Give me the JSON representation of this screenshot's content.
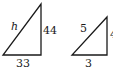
{
  "diagram": {
    "triangles": [
      {
        "id": "large",
        "hypotenuse_label": "h",
        "vertical_leg_label": "44",
        "horizontal_leg_label": "33"
      },
      {
        "id": "small",
        "hypotenuse_label": "5",
        "vertical_leg_label": "4",
        "horizontal_leg_label": "3"
      }
    ],
    "stroke_color": "#1a1a1a"
  }
}
